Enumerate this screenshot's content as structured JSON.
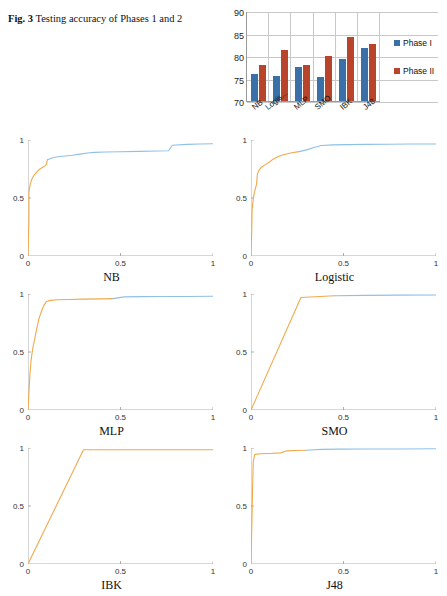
{
  "caption": {
    "fig_number": "Fig. 3",
    "text": "Testing accuracy of Phases 1 and 2"
  },
  "chart_data": [
    {
      "type": "bar",
      "title": "",
      "categories": [
        "NB",
        "Logis...",
        "MLP",
        "SMO",
        "IBK",
        "J48"
      ],
      "series": [
        {
          "name": "Phase I",
          "color": "#3b6fa8",
          "values": [
            76.1,
            75.6,
            77.6,
            75.3,
            79.4,
            81.7
          ]
        },
        {
          "name": "Phase II",
          "color": "#b8442c",
          "values": [
            78.1,
            81.4,
            78.1,
            79.9,
            84.3,
            82.7
          ]
        }
      ],
      "yticks": [
        "90",
        "85",
        "80",
        "75",
        "70"
      ],
      "ylim": [
        70,
        90
      ],
      "xlabel": "",
      "ylabel": "",
      "grid": true,
      "legend_position": "right",
      "legend": [
        "Phase I",
        "Phase II"
      ]
    },
    {
      "type": "line",
      "title": "NB",
      "xlabel": "",
      "ylabel": "",
      "xticks": [
        "0",
        "0.5",
        "1"
      ],
      "yticks": [
        "0",
        "0.5",
        "1"
      ],
      "xlim": [
        0,
        1
      ],
      "ylim": [
        0,
        1
      ],
      "series": [
        {
          "name": "segment-orange",
          "color": "#f0a94c",
          "points": [
            [
              0,
              0
            ],
            [
              0.005,
              0.3
            ],
            [
              0.005,
              0.55
            ],
            [
              0.012,
              0.62
            ],
            [
              0.02,
              0.66
            ],
            [
              0.03,
              0.69
            ],
            [
              0.04,
              0.71
            ],
            [
              0.05,
              0.73
            ],
            [
              0.06,
              0.745
            ],
            [
              0.075,
              0.76
            ],
            [
              0.09,
              0.775
            ],
            [
              0.1,
              0.79
            ],
            [
              0.105,
              0.83
            ]
          ]
        },
        {
          "name": "segment-blue",
          "color": "#8fc0e8",
          "points": [
            [
              0.105,
              0.83
            ],
            [
              0.13,
              0.845
            ],
            [
              0.16,
              0.855
            ],
            [
              0.2,
              0.862
            ],
            [
              0.24,
              0.868
            ],
            [
              0.28,
              0.878
            ],
            [
              0.32,
              0.888
            ],
            [
              0.36,
              0.893
            ],
            [
              0.42,
              0.896
            ],
            [
              0.5,
              0.899
            ],
            [
              0.6,
              0.902
            ],
            [
              0.7,
              0.905
            ],
            [
              0.76,
              0.907
            ],
            [
              0.78,
              0.955
            ],
            [
              0.86,
              0.962
            ],
            [
              0.93,
              0.965
            ],
            [
              1,
              0.968
            ]
          ]
        }
      ]
    },
    {
      "type": "line",
      "title": "Logistic",
      "xlabel": "",
      "ylabel": "",
      "xticks": [
        "0",
        "0.5",
        "1"
      ],
      "yticks": [
        "0",
        "0.5",
        "1"
      ],
      "xlim": [
        0,
        1
      ],
      "ylim": [
        0,
        1
      ],
      "series": [
        {
          "name": "segment-orange",
          "color": "#f0a94c",
          "points": [
            [
              0,
              0
            ],
            [
              0.004,
              0.22
            ],
            [
              0.006,
              0.4
            ],
            [
              0.01,
              0.46
            ],
            [
              0.015,
              0.52
            ],
            [
              0.02,
              0.56
            ],
            [
              0.03,
              0.62
            ],
            [
              0.035,
              0.71
            ],
            [
              0.045,
              0.745
            ],
            [
              0.06,
              0.77
            ],
            [
              0.08,
              0.79
            ],
            [
              0.1,
              0.81
            ],
            [
              0.12,
              0.835
            ],
            [
              0.15,
              0.86
            ],
            [
              0.18,
              0.875
            ],
            [
              0.22,
              0.89
            ],
            [
              0.26,
              0.9
            ]
          ]
        },
        {
          "name": "segment-blue",
          "color": "#8fc0e8",
          "points": [
            [
              0.26,
              0.9
            ],
            [
              0.3,
              0.915
            ],
            [
              0.34,
              0.935
            ],
            [
              0.38,
              0.952
            ],
            [
              0.44,
              0.958
            ],
            [
              0.52,
              0.96
            ],
            [
              0.62,
              0.962
            ],
            [
              0.74,
              0.963
            ],
            [
              0.86,
              0.965
            ],
            [
              1,
              0.966
            ]
          ]
        }
      ]
    },
    {
      "type": "line",
      "title": "MLP",
      "xlabel": "",
      "ylabel": "",
      "xticks": [
        "0",
        "0.5",
        "1"
      ],
      "yticks": [
        "0",
        "0.5",
        "1"
      ],
      "xlim": [
        0,
        1
      ],
      "ylim": [
        0,
        1
      ],
      "series": [
        {
          "name": "segment-orange",
          "color": "#f0a94c",
          "points": [
            [
              0,
              0
            ],
            [
              0.006,
              0.18
            ],
            [
              0.01,
              0.3
            ],
            [
              0.015,
              0.4
            ],
            [
              0.02,
              0.47
            ],
            [
              0.028,
              0.55
            ],
            [
              0.035,
              0.6
            ],
            [
              0.042,
              0.66
            ],
            [
              0.05,
              0.72
            ],
            [
              0.058,
              0.78
            ],
            [
              0.066,
              0.82
            ],
            [
              0.075,
              0.86
            ],
            [
              0.085,
              0.9
            ],
            [
              0.1,
              0.935
            ],
            [
              0.12,
              0.945
            ],
            [
              0.16,
              0.95
            ],
            [
              0.22,
              0.953
            ],
            [
              0.3,
              0.956
            ],
            [
              0.4,
              0.958
            ],
            [
              0.46,
              0.96
            ]
          ]
        },
        {
          "name": "segment-blue",
          "color": "#8fc0e8",
          "points": [
            [
              0.46,
              0.96
            ],
            [
              0.52,
              0.975
            ],
            [
              0.62,
              0.977
            ],
            [
              0.74,
              0.978
            ],
            [
              0.86,
              0.979
            ],
            [
              1,
              0.98
            ]
          ]
        }
      ]
    },
    {
      "type": "line",
      "title": "SMO",
      "xlabel": "",
      "ylabel": "",
      "xticks": [
        "0",
        "0.5",
        "1"
      ],
      "yticks": [
        "0",
        "0.5",
        "1"
      ],
      "xlim": [
        0,
        1
      ],
      "ylim": [
        0,
        1
      ],
      "series": [
        {
          "name": "segment-orange",
          "color": "#f0a94c",
          "points": [
            [
              0,
              0
            ],
            [
              0.27,
              0.97
            ],
            [
              0.45,
              0.985
            ]
          ]
        },
        {
          "name": "segment-blue",
          "color": "#8fc0e8",
          "points": [
            [
              0.45,
              0.985
            ],
            [
              0.62,
              0.988
            ],
            [
              0.8,
              0.99
            ],
            [
              1,
              0.992
            ]
          ]
        }
      ]
    },
    {
      "type": "line",
      "title": "IBK",
      "xlabel": "",
      "ylabel": "",
      "xticks": [
        "0",
        "0.5",
        "1"
      ],
      "yticks": [
        "0",
        "0.5",
        "1"
      ],
      "xlim": [
        0,
        1
      ],
      "ylim": [
        0,
        1
      ],
      "series": [
        {
          "name": "segment-orange",
          "color": "#f0a94c",
          "points": [
            [
              0,
              0
            ],
            [
              0.3,
              0.985
            ],
            [
              1,
              0.985
            ]
          ]
        }
      ]
    },
    {
      "type": "line",
      "title": "J48",
      "xlabel": "",
      "ylabel": "",
      "xticks": [
        "0",
        "0.5",
        "1"
      ],
      "yticks": [
        "0",
        "0.5",
        "1"
      ],
      "xlim": [
        0,
        1
      ],
      "ylim": [
        0,
        1
      ],
      "series": [
        {
          "name": "segment-orange",
          "color": "#f0a94c",
          "points": [
            [
              0,
              0
            ],
            [
              0.008,
              0.6
            ],
            [
              0.012,
              0.88
            ],
            [
              0.02,
              0.945
            ],
            [
              0.05,
              0.95
            ],
            [
              0.1,
              0.953
            ],
            [
              0.16,
              0.958
            ],
            [
              0.19,
              0.975
            ],
            [
              0.24,
              0.978
            ],
            [
              0.3,
              0.98
            ]
          ]
        },
        {
          "name": "segment-blue",
          "color": "#8fc0e8",
          "points": [
            [
              0.3,
              0.98
            ],
            [
              0.38,
              0.988
            ],
            [
              0.48,
              0.99
            ],
            [
              0.62,
              0.991
            ],
            [
              0.8,
              0.992
            ],
            [
              1,
              0.993
            ]
          ]
        }
      ]
    }
  ]
}
